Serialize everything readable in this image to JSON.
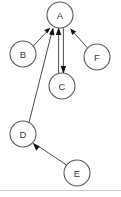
{
  "diagram": {
    "type": "directed-graph",
    "title": "",
    "background_color": "#ffffff",
    "node_fill": "#ffffff",
    "node_stroke": "#5a5a5a",
    "edge_color": "#4a4a4a",
    "arrowhead_color": "#111111",
    "divider_color": "#cccccc",
    "nodes": [
      {
        "id": "A",
        "label": "A",
        "cx": 60,
        "cy": 15,
        "r": 13
      },
      {
        "id": "B",
        "label": "B",
        "cx": 23,
        "cy": 54,
        "r": 13
      },
      {
        "id": "F",
        "label": "F",
        "cx": 97,
        "cy": 57,
        "r": 13
      },
      {
        "id": "C",
        "label": "C",
        "cx": 62,
        "cy": 86,
        "r": 13
      },
      {
        "id": "D",
        "label": "D",
        "cx": 23,
        "cy": 134,
        "r": 13
      },
      {
        "id": "E",
        "label": "E",
        "cx": 77,
        "cy": 173,
        "r": 13
      }
    ],
    "edges": [
      {
        "id": "B-A",
        "from": "B",
        "to": "A",
        "directed": true,
        "label": ""
      },
      {
        "id": "F-A",
        "from": "F",
        "to": "A",
        "directed": true,
        "label": ""
      },
      {
        "id": "C-A",
        "from": "C",
        "to": "A",
        "directed": true,
        "label": ""
      },
      {
        "id": "A-C",
        "from": "A",
        "to": "C",
        "directed": true,
        "label": ""
      },
      {
        "id": "D-A",
        "from": "D",
        "to": "A",
        "directed": true,
        "label": ""
      },
      {
        "id": "E-D",
        "from": "E",
        "to": "D",
        "directed": true,
        "label": ""
      }
    ]
  }
}
